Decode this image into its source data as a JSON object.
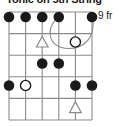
{
  "diagram": {
    "title": "Tonic on 5th String",
    "fret_position_label": "9 fr",
    "type": "guitar-chord-diagram",
    "strings": 6,
    "frets": 5,
    "colors": {
      "grid": "#8a8a8a",
      "filled_dot": "#1a1a1a",
      "open_dot_stroke": "#1a1a1a",
      "open_dot_fill": "#ffffff",
      "triangle_stroke": "#8a8a8a",
      "barre_stroke": "#8a8a8a",
      "text": "#1a1a1a",
      "background": "#ffffff"
    },
    "geometry": {
      "left": 9,
      "right": 92,
      "top": 12,
      "bottom": 120,
      "string_spacing": 16.6,
      "fret_spacing": 21.6
    },
    "markers": [
      {
        "name": "marker-s1-f1",
        "string": 1,
        "fret": 1,
        "shape": "filled-dot"
      },
      {
        "name": "marker-s2-f1",
        "string": 2,
        "fret": 1,
        "shape": "filled-dot"
      },
      {
        "name": "marker-s3-f1",
        "string": 3,
        "fret": 1,
        "shape": "filled-dot"
      },
      {
        "name": "marker-s4-f1",
        "string": 4,
        "fret": 1,
        "shape": "filled-dot"
      },
      {
        "name": "marker-s6-f1",
        "string": 6,
        "fret": 1,
        "shape": "filled-dot"
      },
      {
        "name": "marker-s3-f2",
        "string": 3,
        "fret": 2,
        "shape": "triangle"
      },
      {
        "name": "marker-s5-f2",
        "string": 5,
        "fret": 2,
        "shape": "open-dot"
      },
      {
        "name": "marker-s3-f3",
        "string": 3,
        "fret": 3,
        "shape": "filled-dot"
      },
      {
        "name": "marker-s4-f3",
        "string": 4,
        "fret": 3,
        "shape": "filled-dot"
      },
      {
        "name": "marker-s1-f4",
        "string": 1,
        "fret": 4,
        "shape": "filled-dot"
      },
      {
        "name": "marker-s2-f4",
        "string": 2,
        "fret": 4,
        "shape": "open-dot"
      },
      {
        "name": "marker-s5-f4",
        "string": 5,
        "fret": 4,
        "shape": "filled-dot"
      },
      {
        "name": "marker-s6-f4",
        "string": 6,
        "fret": 4,
        "shape": "filled-dot"
      },
      {
        "name": "marker-s5-f5",
        "string": 5,
        "fret": 5,
        "shape": "triangle"
      }
    ],
    "barre": {
      "name": "barre-curve",
      "from_string": 4,
      "to_string": 6,
      "fret": 1,
      "style": "curved-slur"
    }
  }
}
